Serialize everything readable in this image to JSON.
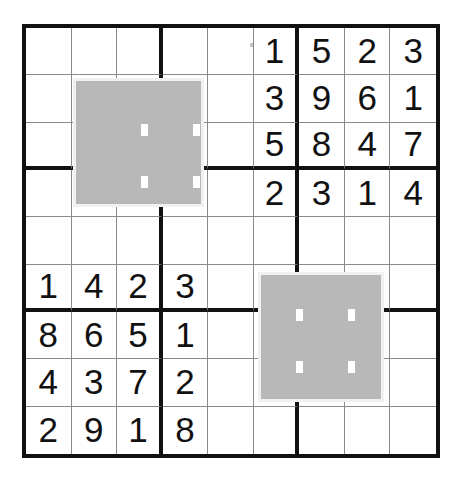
{
  "app": {
    "title": "Sudoku Grid",
    "background_color": "#ffffff",
    "grid_line_color": "#8a8a8a",
    "grid_border_color": "#111111",
    "digit_color": "#111111",
    "selection_fill_color": "#b8b8b8",
    "selection_edge_color": "#f1f1f1",
    "selection_handle_color": "#ffffff"
  },
  "grid": {
    "size": 9,
    "block_size": 3,
    "left": 22,
    "top": 24,
    "width": 418,
    "height": 434,
    "cell_width": 46.4,
    "cell_height": 48.2,
    "outer_border_width": 4,
    "block_border_width": 4,
    "cell_border_width": 1,
    "rows": [
      [
        "",
        "",
        "",
        "",
        "",
        "1",
        "5",
        "2",
        "3"
      ],
      [
        "",
        "",
        "",
        "",
        "",
        "3",
        "9",
        "6",
        "1"
      ],
      [
        "",
        "",
        "",
        "",
        "",
        "5",
        "8",
        "4",
        "7"
      ],
      [
        "",
        "",
        "",
        "",
        "",
        "2",
        "3",
        "1",
        "4"
      ],
      [
        "",
        "",
        "",
        "",
        "",
        "",
        "",
        "",
        ""
      ],
      [
        "1",
        "4",
        "2",
        "3",
        "",
        "",
        "",
        "",
        ""
      ],
      [
        "8",
        "6",
        "5",
        "1",
        "",
        "",
        "",
        "",
        ""
      ],
      [
        "4",
        "3",
        "7",
        "2",
        "",
        "",
        "",
        "",
        ""
      ],
      [
        "2",
        "9",
        "1",
        "8",
        "",
        "",
        "",
        "",
        ""
      ]
    ]
  },
  "selections": [
    {
      "name": "selection-top-left",
      "left": 73,
      "top": 78,
      "width": 131,
      "height": 129,
      "covers_rows": "2-4",
      "covers_cols": "2-4",
      "handles": [
        {
          "left": 65,
          "top": 43
        },
        {
          "left": 65,
          "top": 95
        },
        {
          "left": 117,
          "top": 43
        },
        {
          "left": 117,
          "top": 95
        }
      ]
    },
    {
      "name": "selection-bottom-right",
      "left": 258,
      "top": 272,
      "width": 126,
      "height": 130,
      "covers_rows": "6-8",
      "covers_cols": "6-8",
      "handles": [
        {
          "left": 35,
          "top": 34
        },
        {
          "left": 35,
          "top": 86
        },
        {
          "left": 87,
          "top": 34
        },
        {
          "left": 87,
          "top": 86
        }
      ]
    }
  ],
  "artifacts": {
    "scan_dot": {
      "name": "scan-artifact-dot",
      "left": 250,
      "top": 43,
      "color": "#b9b9b9"
    }
  }
}
